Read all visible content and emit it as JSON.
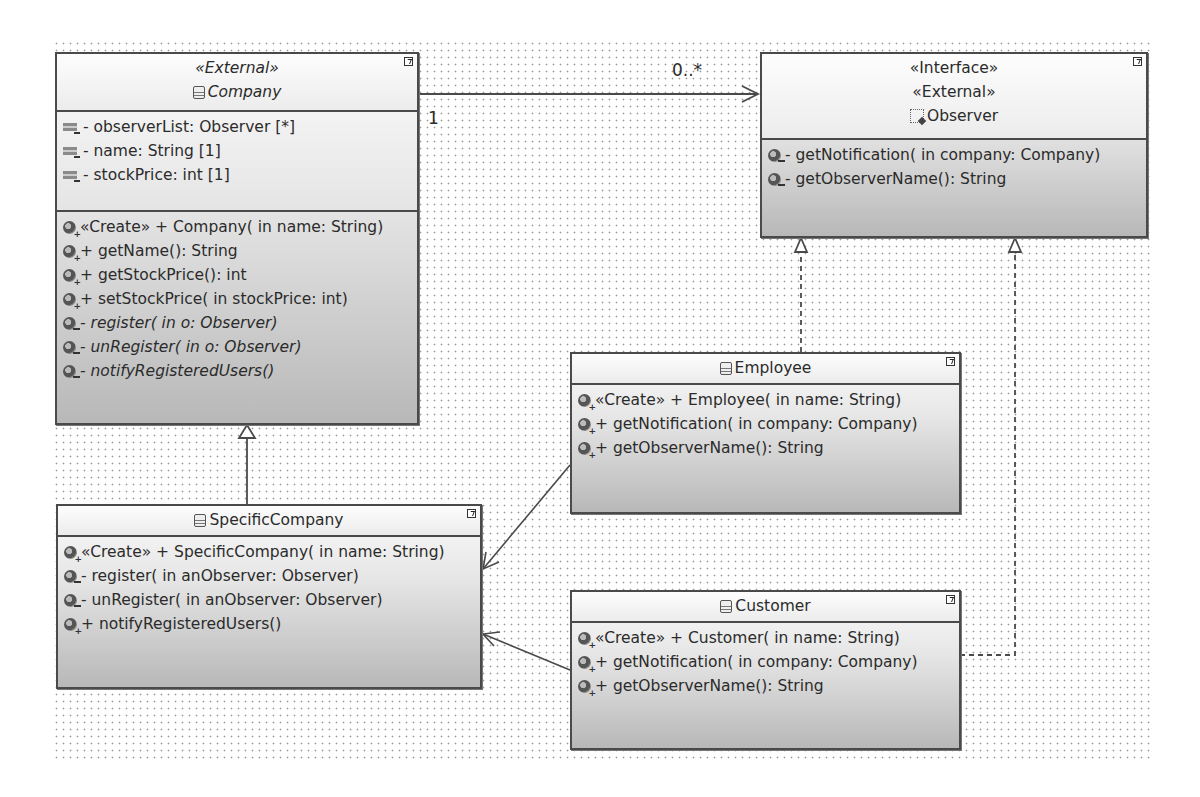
{
  "diagram": {
    "type": "UML class diagram",
    "pattern": "Observer"
  },
  "classes": {
    "company": {
      "stereotype": "«External»",
      "name": "Company",
      "abstract": true,
      "attributes": [
        "- observerList: Observer [*]",
        "- name: String [1]",
        "- stockPrice: int [1]"
      ],
      "operations": [
        {
          "text": "«Create»  + Company(  in name: String)",
          "visibility": "public",
          "italic": false
        },
        {
          "text": " + getName(): String",
          "visibility": "public",
          "italic": false
        },
        {
          "text": " + getStockPrice(): int",
          "visibility": "public",
          "italic": false
        },
        {
          "text": " + setStockPrice(  in stockPrice: int)",
          "visibility": "public",
          "italic": false
        },
        {
          "text": " - register(  in o: Observer)",
          "visibility": "private",
          "italic": true
        },
        {
          "text": " - unRegister(  in o: Observer)",
          "visibility": "private",
          "italic": true
        },
        {
          "text": " - notifyRegisteredUsers()",
          "visibility": "private",
          "italic": true
        }
      ]
    },
    "observer": {
      "stereotypes": [
        "«Interface»",
        "«External»"
      ],
      "name": "Observer",
      "operations": [
        {
          "text": " - getNotification(  in company: Company)",
          "visibility": "private"
        },
        {
          "text": " - getObserverName(): String",
          "visibility": "private"
        }
      ]
    },
    "employee": {
      "name": "Employee",
      "operations": [
        {
          "text": "«Create»  + Employee(  in name: String)",
          "visibility": "public"
        },
        {
          "text": " + getNotification(  in company: Company)",
          "visibility": "public"
        },
        {
          "text": " + getObserverName(): String",
          "visibility": "public"
        }
      ]
    },
    "specific_company": {
      "name": "SpecificCompany",
      "operations": [
        {
          "text": "«Create»  + SpecificCompany(  in name: String)",
          "visibility": "public"
        },
        {
          "text": " - register(  in anObserver: Observer)",
          "visibility": "private"
        },
        {
          "text": " - unRegister(  in anObserver: Observer)",
          "visibility": "private"
        },
        {
          "text": " + notifyRegisteredUsers()",
          "visibility": "public"
        }
      ]
    },
    "customer": {
      "name": "Customer",
      "operations": [
        {
          "text": "«Create»  + Customer(  in name: String)",
          "visibility": "public"
        },
        {
          "text": " + getNotification(  in company: Company)",
          "visibility": "public"
        },
        {
          "text": " + getObserverName(): String",
          "visibility": "public"
        }
      ]
    }
  },
  "relationships": [
    {
      "type": "association",
      "from": "Company",
      "to": "Observer",
      "source_multiplicity": "1",
      "target_multiplicity": "0..*"
    },
    {
      "type": "generalization",
      "from": "SpecificCompany",
      "to": "Company"
    },
    {
      "type": "realization",
      "from": "Employee",
      "to": "Observer"
    },
    {
      "type": "realization",
      "from": "Customer",
      "to": "Observer"
    },
    {
      "type": "dependency",
      "from": "Employee",
      "to": "SpecificCompany"
    },
    {
      "type": "dependency",
      "from": "Customer",
      "to": "SpecificCompany"
    }
  ],
  "labels": {
    "mult_source": "1",
    "mult_target": "0..*"
  }
}
